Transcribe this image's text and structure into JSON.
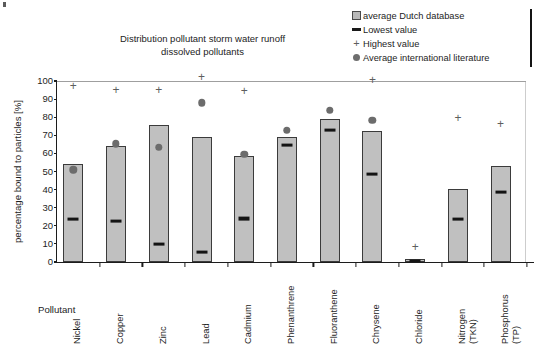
{
  "chart_data": {
    "type": "bar",
    "title": "Distribution pollutant storm water runoff dissolved pollutants",
    "title_line1": "Distribution pollutant storm water runoff",
    "title_line2": "dissolved pollutants",
    "xlabel": "Pollutant",
    "ylabel": "percentage bound to particles [%]",
    "ylim": [
      0,
      100
    ],
    "yticks": [
      0,
      10,
      20,
      30,
      40,
      50,
      60,
      70,
      80,
      90,
      100
    ],
    "grid": false,
    "legend_position": "top-right",
    "categories": [
      "Nickel",
      "Copper",
      "Zinc",
      "Lead",
      "Cadmium",
      "Phenanthrene",
      "Fluoranthene",
      "Chrysene",
      "Chloride",
      "Nitrogen\n(TKN)",
      "Phosphorus\n(TP)"
    ],
    "series": [
      {
        "name": "average Dutch database",
        "marker": "bar",
        "color": "#c0c0c0",
        "values": [
          54,
          64,
          75.5,
          69,
          58.5,
          69,
          79,
          72.5,
          1.5,
          40.5,
          53
        ]
      },
      {
        "name": "Lowest value",
        "marker": "dash",
        "color": "#141414",
        "values": [
          23.5,
          22.5,
          10,
          5.5,
          24,
          64.5,
          73,
          48.5,
          0.5,
          23.5,
          38.5
        ]
      },
      {
        "name": "Highest value",
        "marker": "plus",
        "color": "#5e5e5e",
        "values": [
          94,
          91.5,
          91.5,
          99,
          91,
          null,
          null,
          97.5,
          5,
          76,
          73
        ]
      },
      {
        "name": "Average international literature",
        "marker": "dot",
        "color": "#6c6c6c",
        "values": [
          53,
          67.5,
          65.5,
          90,
          61.5,
          75,
          86,
          80.5,
          null,
          null,
          null
        ]
      }
    ]
  },
  "legend": {
    "items": [
      {
        "label": "average Dutch database",
        "key": "box-icon"
      },
      {
        "label": "Lowest value",
        "key": "dash-icon"
      },
      {
        "label": "Highest value",
        "key": "plus-icon"
      },
      {
        "label": "Average international literature",
        "key": "dot-icon"
      }
    ]
  },
  "colors": {
    "bar_fill": "#c0c0c0",
    "bar_stroke": "#3b3b3b",
    "dash": "#141414",
    "plus": "#5e5e5e",
    "dot": "#6c6c6c",
    "axis": "#1c1c1c",
    "gridline": "#cfcfcf"
  }
}
